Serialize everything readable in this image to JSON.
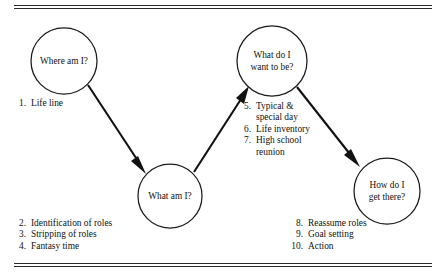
{
  "figure": {
    "type": "flow-diagram",
    "orientation": "left-to-right zigzag",
    "nodes": [
      {
        "id": "where-am-i",
        "label_lines": [
          "Where am I?"
        ],
        "cx": 64,
        "cy": 61,
        "r": 33
      },
      {
        "id": "what-am-i",
        "label_lines": [
          "What am I?"
        ],
        "cx": 170,
        "cy": 196,
        "r": 32
      },
      {
        "id": "what-do-i-want-to-be",
        "label_lines": [
          "What do I",
          "want to be?"
        ],
        "cx": 272,
        "cy": 61,
        "r": 35
      },
      {
        "id": "how-do-i-get-there",
        "label_lines": [
          "How do I",
          "get there?"
        ],
        "cx": 387,
        "cy": 191,
        "r": 33
      }
    ],
    "edges": [
      {
        "from": "where-am-i",
        "to": "what-am-i"
      },
      {
        "from": "what-am-i",
        "to": "what-do-i-want-to-be"
      },
      {
        "from": "what-do-i-want-to-be",
        "to": "how-do-i-get-there"
      }
    ]
  },
  "lists": {
    "life_line": {
      "name": "life-line-list",
      "items": [
        {
          "num": "1.",
          "lines": [
            "Life line"
          ]
        }
      ]
    },
    "what_am_i": {
      "name": "what-am-i-list",
      "items": [
        {
          "num": "2.",
          "lines": [
            "Identification of roles"
          ]
        },
        {
          "num": "3.",
          "lines": [
            "Stripping of roles"
          ]
        },
        {
          "num": "4.",
          "lines": [
            "Fantasy time"
          ]
        }
      ]
    },
    "want_to_be": {
      "name": "want-to-be-list",
      "items": [
        {
          "num": "5.",
          "lines": [
            "Typical &",
            "special day"
          ]
        },
        {
          "num": "6.",
          "lines": [
            "Life inventory"
          ]
        },
        {
          "num": "7.",
          "lines": [
            "High school",
            "reunion"
          ]
        }
      ]
    },
    "get_there": {
      "name": "get-there-list",
      "items": [
        {
          "num": "8.",
          "lines": [
            "Reassume roles"
          ]
        },
        {
          "num": "9.",
          "lines": [
            "Goal setting"
          ]
        },
        {
          "num": "10.",
          "lines": [
            "Action"
          ]
        }
      ]
    }
  },
  "colors": {
    "ink": "#111111",
    "rule": "#2b2b2b",
    "page": "#ffffff"
  }
}
